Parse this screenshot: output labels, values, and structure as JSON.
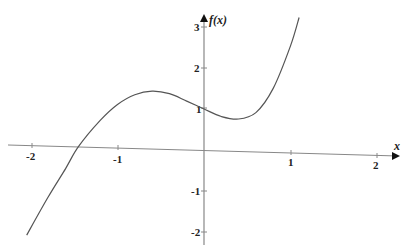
{
  "chart_data": {
    "type": "line",
    "title": "",
    "xlabel": "x",
    "ylabel": "f(x)",
    "xlim": [
      -2.3,
      2.3
    ],
    "ylim": [
      -2.3,
      3.2
    ],
    "grid": false,
    "legend": null,
    "x_ticks": [
      "-2",
      "-1",
      "1",
      "2"
    ],
    "y_ticks": [
      "3",
      "2",
      "1",
      "-1",
      "-2"
    ],
    "series": [
      {
        "name": "f(x)",
        "x": [
          -2.05,
          -1.8,
          -1.6,
          -1.45,
          -1.2,
          -1.0,
          -0.8,
          -0.6,
          -0.4,
          -0.2,
          0.0,
          0.2,
          0.4,
          0.6,
          0.8,
          1.0,
          1.1
        ],
        "y": [
          -2.2,
          -1.25,
          -0.55,
          0.0,
          0.65,
          1.05,
          1.3,
          1.4,
          1.35,
          1.18,
          1.0,
          0.83,
          0.78,
          0.95,
          1.55,
          2.6,
          3.3
        ]
      }
    ],
    "annotations": {
      "local_max": {
        "x": -0.6,
        "y": 1.4
      },
      "local_min": {
        "x": 0.4,
        "y": 0.78
      },
      "y_intercept": {
        "x": 0,
        "y": 1
      },
      "x_intercept": {
        "x": -1.45,
        "y": 0
      }
    }
  },
  "axes": {
    "x_label": "x",
    "y_label": "f(x)",
    "x_tick_labels": [
      "-2",
      "-1",
      "1",
      "2"
    ],
    "y_tick_labels": [
      "3",
      "2",
      "1",
      "-1",
      "-2"
    ]
  },
  "colors": {
    "curve": "#555555",
    "axis": "#888888",
    "text": "#222222"
  }
}
